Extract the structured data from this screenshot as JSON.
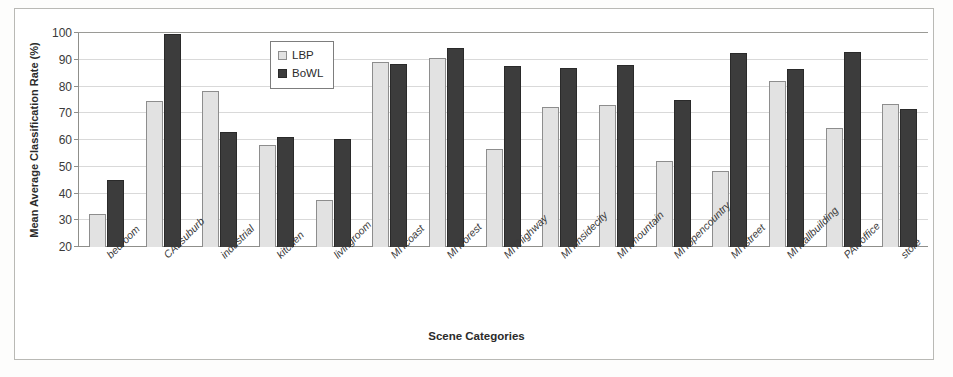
{
  "chart_data": {
    "type": "bar",
    "title": "",
    "xlabel": "Scene Categories",
    "ylabel": "Mean Average Classification Rate (%)",
    "ylim": [
      20,
      100
    ],
    "yticks": [
      20,
      30,
      40,
      50,
      60,
      70,
      80,
      90,
      100
    ],
    "grid": true,
    "legend_position": "top-center-inside",
    "categories": [
      "bedroom",
      "CALsuburb",
      "industrial",
      "kitchen",
      "livingroom",
      "MITcoast",
      "MITforest",
      "MIThighway",
      "MITinsidecity",
      "MITmountain",
      "MITopencountry",
      "MITstreet",
      "MITtallbuilding",
      "PARoffice",
      "store"
    ],
    "series": [
      {
        "name": "LBP",
        "color": "#e2e2e2",
        "values": [
          32.5,
          74.5,
          78.5,
          58.0,
          37.5,
          89.0,
          90.5,
          56.5,
          72.5,
          73.0,
          52.0,
          48.5,
          82.0,
          64.5,
          73.5
        ]
      },
      {
        "name": "BoWL",
        "color": "#3c3c3c",
        "values": [
          45.0,
          99.5,
          63.0,
          61.0,
          60.5,
          88.5,
          94.5,
          87.5,
          87.0,
          88.0,
          75.0,
          92.5,
          86.5,
          93.0,
          71.5
        ]
      }
    ]
  },
  "legend": {
    "items": [
      {
        "label": "LBP",
        "swatch": "light-gray-square"
      },
      {
        "label": "BoWL",
        "swatch": "dark-gray-square"
      }
    ]
  }
}
